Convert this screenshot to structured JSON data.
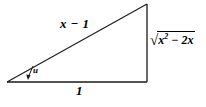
{
  "figure": {
    "type": "right-triangle-diagram",
    "stroke_color": "#1a1a1a",
    "text_color": "#000000",
    "background_color": "#ffffff",
    "vertices": {
      "left": [
        7,
        82
      ],
      "bottom_right": [
        147,
        82
      ],
      "top_right": [
        147,
        4
      ]
    },
    "labels": {
      "hypotenuse": "x − 1",
      "base": "1",
      "angle": "u",
      "opposite_sqrt_sign": "√",
      "opposite_radicand_base": "x",
      "opposite_radicand_exponent": "2",
      "opposite_radicand_rest": " − 2x"
    }
  }
}
